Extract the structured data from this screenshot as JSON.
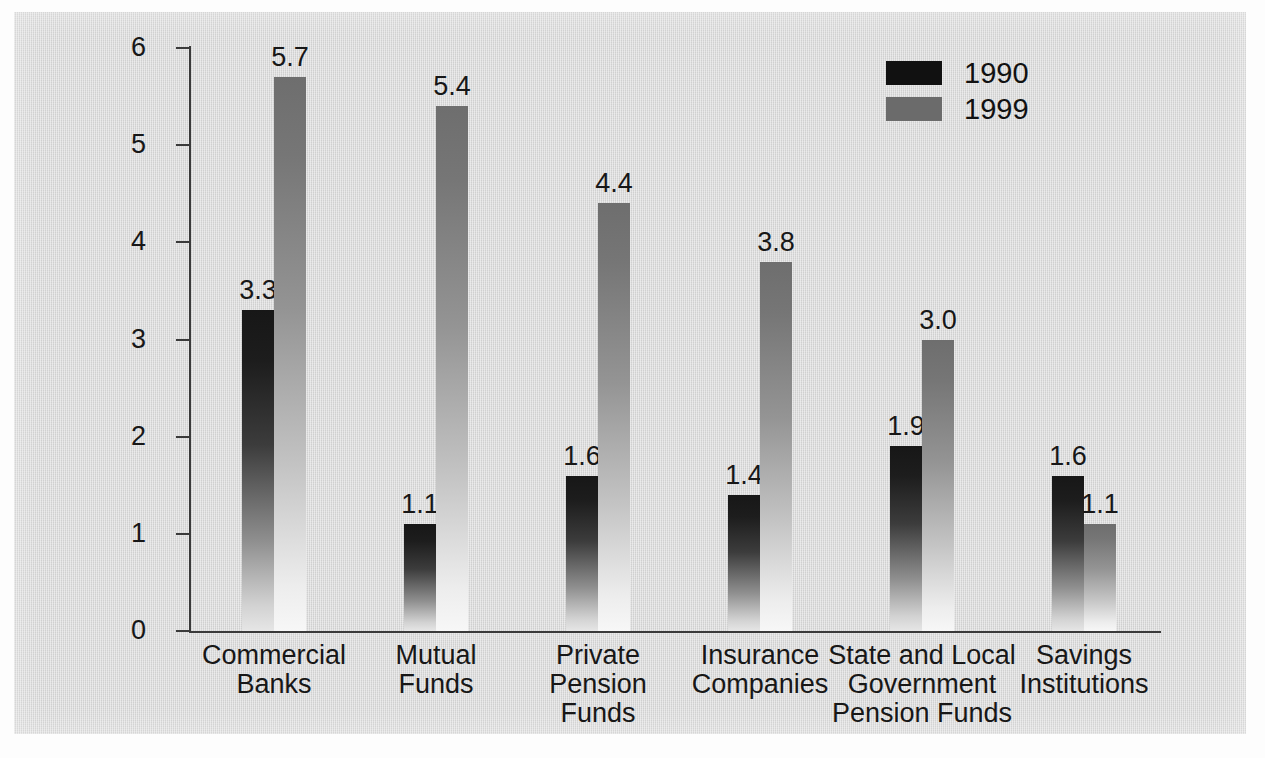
{
  "chart_data": {
    "type": "bar",
    "title": "",
    "subtitle": "",
    "xlabel": "",
    "ylabel": "",
    "ylim": [
      0,
      6
    ],
    "ytick_labels": [
      "0",
      "1",
      "2",
      "3",
      "4",
      "5",
      "6"
    ],
    "yticks": [
      0,
      1,
      2,
      3,
      4,
      5,
      6
    ],
    "grid": false,
    "legend_position": "top-right",
    "categories": [
      "Commercial\nBanks",
      "Mutual\nFunds",
      "Private\nPension\nFunds",
      "Insurance\nCompanies",
      "State and Local\nGovernment\nPension Funds",
      "Savings\nInstitutions"
    ],
    "category_lines": [
      [
        "Commercial",
        "Banks"
      ],
      [
        "Mutual",
        "Funds"
      ],
      [
        "Private",
        "Pension",
        "Funds"
      ],
      [
        "Insurance",
        "Companies"
      ],
      [
        "State and Local",
        "Government",
        "Pension Funds"
      ],
      [
        "Savings",
        "Institutions"
      ]
    ],
    "series": [
      {
        "name": "1990",
        "color": "#111111",
        "values": [
          3.3,
          1.1,
          1.6,
          1.4,
          1.9,
          1.6
        ],
        "value_labels": [
          "3.3",
          "1.1",
          "1.6",
          "1.4",
          "1.9",
          "1.6"
        ]
      },
      {
        "name": "1999",
        "color": "#6b6b6b",
        "values": [
          5.7,
          5.4,
          4.4,
          3.8,
          3.0,
          1.1
        ],
        "value_labels": [
          "5.7",
          "5.4",
          "4.4",
          "3.8",
          "3.0",
          "1.1"
        ]
      }
    ]
  },
  "legend": {
    "items": [
      {
        "label": "1990",
        "swatch": "#111111"
      },
      {
        "label": "1999",
        "swatch": "#6b6b6b"
      }
    ]
  },
  "axis": {
    "y_tick_labels": [
      "6",
      "5",
      "4",
      "3",
      "2",
      "1",
      "0"
    ]
  }
}
